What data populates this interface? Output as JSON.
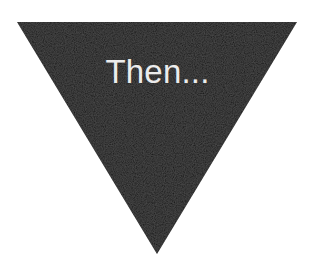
{
  "diagram": {
    "shape": "inverted-triangle",
    "fill_color": "#121212",
    "text_color": "#ececec",
    "background_color": "#ffffff",
    "label": "Then...",
    "vertices": {
      "top_left": [
        17,
        22
      ],
      "top_right": [
        297,
        22
      ],
      "bottom": [
        157,
        254
      ]
    }
  }
}
